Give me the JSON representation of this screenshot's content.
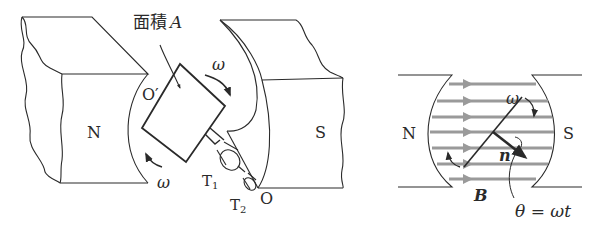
{
  "left_figure": {
    "pole_north": "N",
    "pole_south": "S",
    "area_label": "面積",
    "area_symbol": "A",
    "axis_top": "O′",
    "axis_bottom": "O",
    "omega_top": "ω",
    "omega_bottom": "ω",
    "terminal_1": "T",
    "terminal_1_sub": "1",
    "terminal_2": "T",
    "terminal_2_sub": "2"
  },
  "right_figure": {
    "pole_north": "N",
    "pole_south": "S",
    "omega": "ω",
    "normal_vector": "n",
    "field_vector": "B",
    "angle_formula": "θ = ωt"
  },
  "colors": {
    "line": "#2a2a2a",
    "field_lines": "#9a9a9a",
    "background": "#ffffff"
  }
}
